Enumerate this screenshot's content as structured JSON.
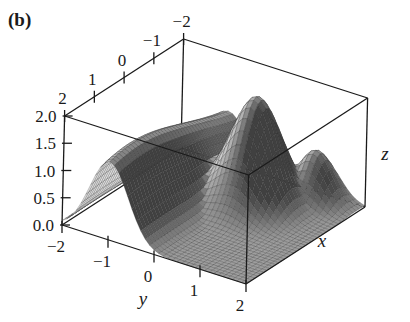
{
  "panel_label": "(b)",
  "panel_label_parts": {
    "open": "(",
    "letter": "b",
    "close": ")"
  },
  "chart_data": {
    "type": "surface3d",
    "title": "",
    "panel": "(b)",
    "xlabel": "x",
    "ylabel": "y",
    "zlabel": "z",
    "xlim": [
      -2,
      2
    ],
    "ylim": [
      -2,
      2
    ],
    "zlim": [
      0,
      2
    ],
    "x_ticks": [
      "2",
      "1",
      "0",
      "−1",
      "−2"
    ],
    "x_tick_values": [
      2,
      1,
      0,
      -1,
      -2
    ],
    "y_ticks": [
      "−2",
      "−1",
      "0",
      "1",
      "2"
    ],
    "y_tick_values": [
      -2,
      -1,
      0,
      1,
      2
    ],
    "z_ticks": [
      "0.0",
      "0.5",
      "1.0",
      "1.5",
      "2.0"
    ],
    "z_tick_values": [
      0,
      0.5,
      1,
      1.5,
      2
    ],
    "surface_description": "Gaussian ridge along x (peak ~1.5 at y=-1) combined with a taller localized bump (peak ~2.0 near x=-1, y=0.5) and a smaller secondary bump near x=-1.5, y=1.2; surface falls to 0 at edges",
    "mesh_resolution": 40,
    "colors": {
      "surface_light": "#d8d8d8",
      "surface_dark": "#4a4a4a",
      "mesh_line": "#2a2a2a",
      "box": "#1a1a1a"
    },
    "grid": false,
    "box": true
  }
}
